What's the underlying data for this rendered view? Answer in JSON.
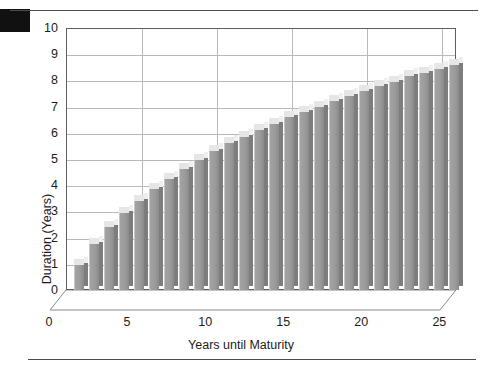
{
  "figure": {
    "corner_mark": "black-square-marker",
    "top_rule": "horizontal-rule",
    "bottom_rule": "horizontal-rule"
  },
  "chart_data": {
    "type": "bar",
    "title": "",
    "subtitle": "",
    "xlabel": "Years until Maturity",
    "ylabel": "Duration (Years)",
    "xlim": [
      0,
      26
    ],
    "ylim": [
      0,
      10
    ],
    "xticks": [
      0,
      5,
      10,
      15,
      20,
      25
    ],
    "yticks": [
      0,
      1,
      2,
      3,
      4,
      5,
      6,
      7,
      8,
      9,
      10
    ],
    "grid": true,
    "legend": "none",
    "style_3d": true,
    "bar_color": "#9b9b9b",
    "bar_top_color": "#e6e6e6",
    "bar_side_color": "#7d7d7d",
    "grid_color": "#b9b9b9",
    "frame_color": "#5f5f5f",
    "categories": [
      1,
      2,
      3,
      4,
      5,
      6,
      7,
      8,
      9,
      10,
      11,
      12,
      13,
      14,
      15,
      16,
      17,
      18,
      19,
      20,
      21,
      22,
      23,
      24,
      25,
      26
    ],
    "values": [
      0.95,
      1.75,
      2.4,
      2.95,
      3.4,
      3.85,
      4.25,
      4.6,
      4.95,
      5.3,
      5.6,
      5.85,
      6.1,
      6.35,
      6.6,
      6.8,
      7.0,
      7.2,
      7.4,
      7.6,
      7.8,
      7.95,
      8.15,
      8.3,
      8.45,
      8.6
    ],
    "series": [
      {
        "name": "Duration",
        "values": [
          0.95,
          1.75,
          2.4,
          2.95,
          3.4,
          3.85,
          4.25,
          4.6,
          4.95,
          5.3,
          5.6,
          5.85,
          6.1,
          6.35,
          6.6,
          6.8,
          7.0,
          7.2,
          7.4,
          7.6,
          7.8,
          7.95,
          8.15,
          8.3,
          8.45,
          8.6
        ]
      }
    ]
  }
}
